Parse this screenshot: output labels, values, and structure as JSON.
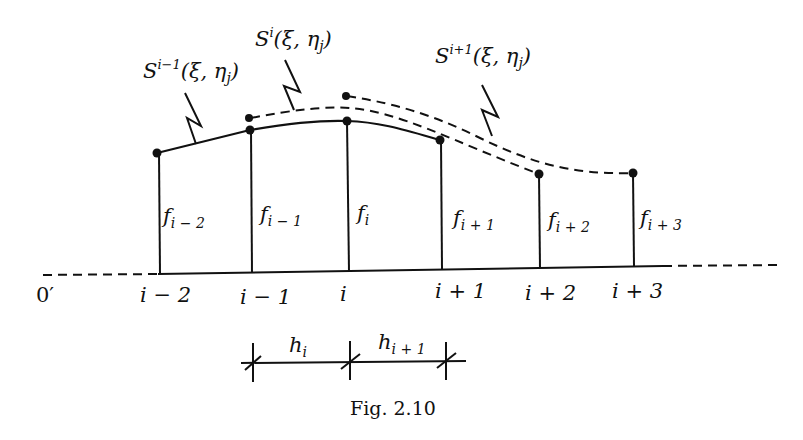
{
  "figure": {
    "caption": "Fig. 2.10",
    "origin_label": "0′",
    "colors": {
      "ink": "#111111",
      "background": "#ffffff"
    }
  },
  "nodes": [
    {
      "id": "i-2",
      "axis_label": "i − 2",
      "value_label": "f",
      "value_sub": "i − 2"
    },
    {
      "id": "i-1",
      "axis_label": "i − 1",
      "value_label": "f",
      "value_sub": "i − 1"
    },
    {
      "id": "i",
      "axis_label": "i",
      "value_label": "f",
      "value_sub": "i"
    },
    {
      "id": "i+1",
      "axis_label": "i + 1",
      "value_label": "f",
      "value_sub": "i + 1"
    },
    {
      "id": "i+2",
      "axis_label": "i + 2",
      "value_label": "f",
      "value_sub": "i + 2"
    },
    {
      "id": "i+3",
      "axis_label": "i + 3",
      "value_label": "f",
      "value_sub": "i + 3"
    }
  ],
  "splines": [
    {
      "id": "S_i_minus_1",
      "base": "S",
      "sup": "i−1",
      "args": "(ξ, η",
      "arg_sub": "j",
      "close": ")",
      "style": "solid",
      "span": "i−2 … i+1"
    },
    {
      "id": "S_i",
      "base": "S",
      "sup": "i",
      "args": "(ξ, η",
      "arg_sub": "j",
      "close": ")",
      "style": "dashed",
      "span": "i−1 … i+2"
    },
    {
      "id": "S_i_plus_1",
      "base": "S",
      "sup": "i+1",
      "args": "(ξ, η",
      "arg_sub": "j",
      "close": ")",
      "style": "dashed",
      "span": "i … i+3"
    }
  ],
  "intervals": [
    {
      "label": "h",
      "sub": "i"
    },
    {
      "label": "h",
      "sub": "i + 1"
    }
  ]
}
